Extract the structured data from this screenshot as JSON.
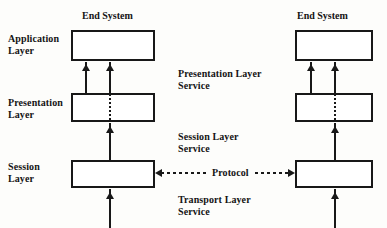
{
  "diagram": {
    "title_left": "End System",
    "title_right": "End System",
    "layers": {
      "application": "Application\nLayer",
      "presentation": "Presentation\nLayer",
      "session": "Session\nLayer"
    },
    "services": {
      "presentation": "Presentation Layer\nService",
      "session": "Session Layer\nService",
      "transport": "Transport Layer\nService"
    },
    "protocol_label": "Protocol",
    "colors": {
      "stroke": "#181818",
      "text": "#141414",
      "background": "#fdfdfb",
      "box_fill": "#ffffff"
    }
  }
}
